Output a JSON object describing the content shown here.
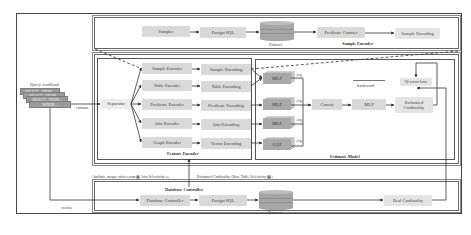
{
  "diagram": {
    "sample_encoder": {
      "title": "Sample Encoder",
      "nodes": {
        "sampler": "Sampler",
        "postgresql": "PostgreSQL",
        "dataset": "Dataset",
        "predicate_counter": "Predicate Counter",
        "sample_encoding": "Sample Encoding"
      }
    },
    "query_workload": {
      "title": "Query workload",
      "queries": [
        "SELECT... FROM...",
        "SELECT... FROM...",
        "SELECT... FROM...",
        "WHERE..."
      ],
      "estimate_label": "estimate",
      "execute_label": "execute"
    },
    "feature_encoder": {
      "title": "Feature Encoder",
      "separator": "Separator",
      "encoders": [
        "Sample Encoder",
        "Table Encoder",
        "Predicate Encoder",
        "Join Encoder",
        "Graph Encoder"
      ],
      "encodings": [
        "Sample Encoding",
        "Table Encoding",
        "Predicate Encoding",
        "Join Encoding",
        "Vector Encoding"
      ]
    },
    "estimate_model": {
      "title": "Estimate Model",
      "models": [
        "MLP",
        "MLP",
        "MLP",
        "GAT"
      ],
      "avg_label": "Avg",
      "concat": "Concat",
      "mlp": "MLP",
      "estimated_cardinality": "Estimated Cardinality",
      "q_error_loss": "Q-error loss",
      "backward": "backward"
    },
    "annotations": {
      "attribute_values": "Attribute unique values num ▩ Join Selectivity ω₁",
      "estimated_cardinality_info": "Estimated Cardinality (Base Table Selectivity ▩)"
    },
    "database_controller": {
      "title": "Database Controller",
      "controller": "Database Controller",
      "postgresql": "PostgreSQL",
      "dataset": "Dataset",
      "real_cardinality": "Real Cardinality"
    }
  },
  "colors": {
    "box_fill": "#d9d9d9",
    "mlp_fill": "#a9a9a9",
    "db_fill": "#a6a6a6",
    "line": "#333333"
  }
}
